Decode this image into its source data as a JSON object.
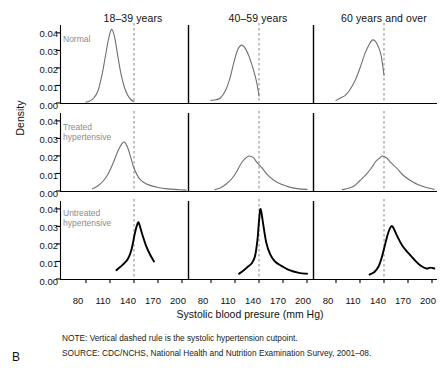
{
  "figure": {
    "letter": "B",
    "ylabel": "Density",
    "xlabel": "Systolic blood presure (mm Hg)",
    "note": "NOTE: Vertical dashed rule is the systolic hypertension cutpoint.",
    "source": "SOURCE: CDC/NCHS, National Health and Nutrition Examination Survey, 2001–08."
  },
  "columns": [
    {
      "label": "18–39 years"
    },
    {
      "label": "40–59 years"
    },
    {
      "label": "60 years and over"
    }
  ],
  "rows": [
    {
      "label_line1": "Normal",
      "label_line2": ""
    },
    {
      "label_line1": "Treated",
      "label_line2": "hypertensive"
    },
    {
      "label_line1": "Untreated",
      "label_line2": "hypertensive"
    }
  ],
  "axis": {
    "yticks": [
      "0.00",
      "0.01",
      "0.02",
      "0.03",
      "0.04"
    ],
    "xticks": [
      "80",
      "110",
      "140",
      "170",
      "200"
    ]
  },
  "colors": {
    "normal_curve": "#6f6f6f",
    "treated_curve": "#6f6f6f",
    "untreated_curve": "#000000",
    "cutpoint_rule": "#9a9a9a",
    "axis": "#000000",
    "panel_label": "#8c8c8c"
  },
  "chart_data": {
    "type": "line",
    "title": "",
    "subtitle": "",
    "xlabel": "Systolic blood presure (mm Hg)",
    "ylabel": "Density",
    "xlim": [
      70,
      210
    ],
    "ylim": [
      0,
      0.045
    ],
    "xticks": [
      80,
      110,
      140,
      170,
      200
    ],
    "yticks": [
      0.0,
      0.01,
      0.02,
      0.03,
      0.04
    ],
    "grid": false,
    "legend": "none",
    "annotations": [
      "Vertical dashed rule is the systolic hypertension cutpoint at 140 mm Hg"
    ],
    "cutpoint": 140,
    "layout": {
      "rows": 3,
      "cols": 3,
      "row_titles": [
        "Normal",
        "Treated hypertensive",
        "Untreated hypertensive"
      ],
      "col_titles": [
        "18-39 years",
        "40-59 years",
        "60 years and over"
      ]
    },
    "panels": [
      {
        "row": "Normal",
        "col": "18-39 years",
        "color": "#6f6f6f",
        "peak_x": 113,
        "peak_y": 0.042,
        "x": [
          80,
          85,
          90,
          95,
          100,
          104,
          108,
          112,
          116,
          120,
          124,
          128,
          132,
          136,
          140
        ],
        "y": [
          0.0005,
          0.0012,
          0.003,
          0.007,
          0.016,
          0.026,
          0.036,
          0.042,
          0.037,
          0.026,
          0.016,
          0.009,
          0.0045,
          0.002,
          0.0008
        ]
      },
      {
        "row": "Normal",
        "col": "40-59 years",
        "color": "#6f6f6f",
        "peak_x": 118,
        "peak_y": 0.033,
        "x": [
          80,
          86,
          92,
          98,
          103,
          108,
          113,
          118,
          123,
          128,
          133,
          137,
          140
        ],
        "y": [
          0.0015,
          0.0018,
          0.003,
          0.007,
          0.013,
          0.022,
          0.03,
          0.033,
          0.031,
          0.026,
          0.019,
          0.012,
          0.004
        ]
      },
      {
        "row": "Normal",
        "col": "60 years and over",
        "color": "#6f6f6f",
        "peak_x": 126,
        "peak_y": 0.036,
        "x": [
          80,
          86,
          92,
          98,
          104,
          110,
          116,
          121,
          126,
          131,
          136,
          140
        ],
        "y": [
          0.0015,
          0.003,
          0.0045,
          0.008,
          0.013,
          0.02,
          0.028,
          0.033,
          0.036,
          0.034,
          0.028,
          0.016
        ]
      },
      {
        "row": "Treated hypertensive",
        "col": "18-39 years",
        "color": "#6f6f6f",
        "peak_x": 128,
        "peak_y": 0.028,
        "x": [
          88,
          95,
          102,
          108,
          114,
          120,
          125,
          128,
          132,
          136,
          140,
          146,
          152,
          160,
          170,
          182,
          195,
          205
        ],
        "y": [
          0.0012,
          0.003,
          0.006,
          0.01,
          0.016,
          0.023,
          0.027,
          0.028,
          0.025,
          0.019,
          0.013,
          0.0075,
          0.005,
          0.0032,
          0.002,
          0.0012,
          0.0008,
          0.0005
        ]
      },
      {
        "row": "Treated hypertensive",
        "col": "40-59 years",
        "color": "#6f6f6f",
        "peak_x": 128,
        "peak_y": 0.02,
        "x": [
          85,
          92,
          99,
          106,
          112,
          118,
          124,
          128,
          133,
          138,
          144,
          151,
          159,
          168,
          178,
          190,
          200
        ],
        "y": [
          0.0008,
          0.0018,
          0.004,
          0.007,
          0.011,
          0.016,
          0.019,
          0.02,
          0.019,
          0.016,
          0.013,
          0.009,
          0.006,
          0.0038,
          0.0022,
          0.0012,
          0.0009
        ]
      },
      {
        "row": "Treated hypertensive",
        "col": "60 years and over",
        "color": "#6f6f6f",
        "peak_x": 138,
        "peak_y": 0.02,
        "x": [
          88,
          96,
          103,
          110,
          117,
          124,
          130,
          135,
          138,
          143,
          149,
          156,
          164,
          173,
          183,
          194,
          203
        ],
        "y": [
          0.0008,
          0.0016,
          0.003,
          0.006,
          0.009,
          0.013,
          0.017,
          0.019,
          0.02,
          0.019,
          0.016,
          0.013,
          0.009,
          0.006,
          0.0035,
          0.0018,
          0.001
        ]
      },
      {
        "row": "Untreated hypertensive",
        "col": "18-39 years",
        "color": "#000000",
        "peak_x": 145,
        "peak_y": 0.032,
        "x": [
          118,
          123,
          128,
          133,
          137,
          141,
          144,
          146,
          150,
          155,
          160,
          165
        ],
        "y": [
          0.005,
          0.007,
          0.009,
          0.012,
          0.017,
          0.026,
          0.031,
          0.032,
          0.026,
          0.019,
          0.014,
          0.01
        ]
      },
      {
        "row": "Untreated hypertensive",
        "col": "40-59 years",
        "color": "#000000",
        "peak_x": 142,
        "peak_y": 0.04,
        "x": [
          115,
          121,
          126,
          131,
          135,
          138,
          140,
          142,
          145,
          149,
          154,
          160,
          168,
          178,
          190,
          200
        ],
        "y": [
          0.003,
          0.005,
          0.007,
          0.009,
          0.013,
          0.022,
          0.033,
          0.04,
          0.032,
          0.021,
          0.014,
          0.01,
          0.0075,
          0.005,
          0.0035,
          0.003
        ]
      },
      {
        "row": "Untreated hypertensive",
        "col": "60 years and over",
        "color": "#000000",
        "peak_x": 150,
        "peak_y": 0.03,
        "x": [
          122,
          128,
          133,
          137,
          141,
          145,
          149,
          152,
          157,
          163,
          170,
          178,
          186,
          193,
          198,
          203
        ],
        "y": [
          0.0025,
          0.004,
          0.007,
          0.012,
          0.019,
          0.026,
          0.03,
          0.029,
          0.024,
          0.019,
          0.015,
          0.011,
          0.0075,
          0.006,
          0.0065,
          0.006
        ]
      }
    ]
  }
}
